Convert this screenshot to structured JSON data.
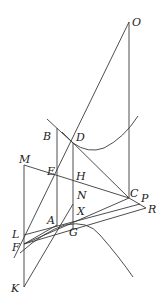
{
  "diagram": {
    "type": "geometric-construction",
    "stroke_color": "#3a3a3a",
    "labels": {
      "O": "O",
      "B": "B",
      "D": "D",
      "M": "M",
      "E": "E",
      "H": "H",
      "N": "N",
      "C": "C",
      "P": "P",
      "R": "R",
      "X": "X",
      "A": "A",
      "L": "L",
      "G": "G",
      "F": "F",
      "K": "K"
    },
    "points": {
      "O": [
        129,
        22
      ],
      "B": [
        57,
        128
      ],
      "D": [
        73,
        143
      ],
      "M": [
        24,
        165
      ],
      "E": [
        57,
        176
      ],
      "H": [
        73,
        181
      ],
      "N": [
        73,
        204
      ],
      "C": [
        129,
        198
      ],
      "P": [
        140,
        204
      ],
      "R": [
        146,
        208
      ],
      "X": [
        74,
        218
      ],
      "A": [
        57,
        225
      ],
      "L": [
        24,
        235
      ],
      "G": [
        76,
        228
      ],
      "F": [
        24,
        244
      ],
      "K": [
        24,
        287
      ]
    },
    "curves": [
      "upper-hyperbola-branch-through-D",
      "lower-parabola-through-A-and-G"
    ]
  }
}
